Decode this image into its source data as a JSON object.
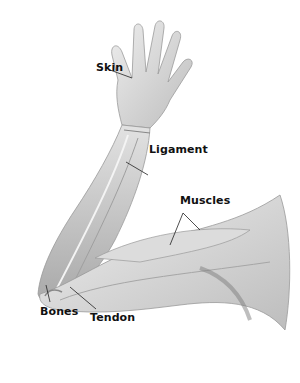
{
  "diagram": {
    "labels": [
      {
        "id": "skin",
        "text": "Skin"
      },
      {
        "id": "ligament",
        "text": "Ligament"
      },
      {
        "id": "muscles",
        "text": "Muscles"
      },
      {
        "id": "bones",
        "text": "Bones"
      },
      {
        "id": "tendon",
        "text": "Tendon"
      }
    ]
  },
  "colors": {
    "background": "#ffffff",
    "label_text": "#111111",
    "leader_line": "#222222",
    "tissue_light": "#e6e6e6",
    "tissue_mid": "#c8c8c8",
    "tissue_dark": "#8a8a8a"
  }
}
